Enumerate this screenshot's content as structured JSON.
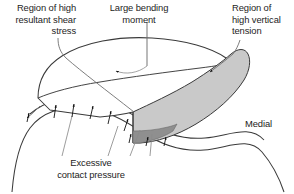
{
  "figure": {
    "annotations": {
      "shear": {
        "lines": [
          "Region of high",
          "resultant shear",
          "stress"
        ],
        "text": "Region of high\nresultant shear\nstress"
      },
      "moment": {
        "lines": [
          "Large bending",
          "moment"
        ],
        "text": "Large bending\nmoment"
      },
      "tension": {
        "lines": [
          "Region of",
          "high vertical",
          "tension"
        ],
        "text": "Region of\nhigh vertical\ntension"
      },
      "pressure": {
        "lines": [
          "Excessive",
          "contact pressure"
        ],
        "text": "Excessive\ncontact pressure"
      },
      "medial": {
        "text": "Medial"
      }
    },
    "icons": {
      "moment_arc": "curved-moment-arrow-icon",
      "pressure_arrows": "upward-pressure-arrow-icon",
      "shear_leader": "leader-arrow-icon",
      "tension_leader": "leader-arrow-icon"
    },
    "colors": {
      "outline": "#3a3a3a",
      "side_wall_fill": "#c9c9c9",
      "dark_patch_fill": "#8f8f8f",
      "background": "#ffffff",
      "text": "#1d1d1d"
    },
    "counts": {
      "pressure_arrows": 9,
      "pressure_leaders": 3
    }
  }
}
